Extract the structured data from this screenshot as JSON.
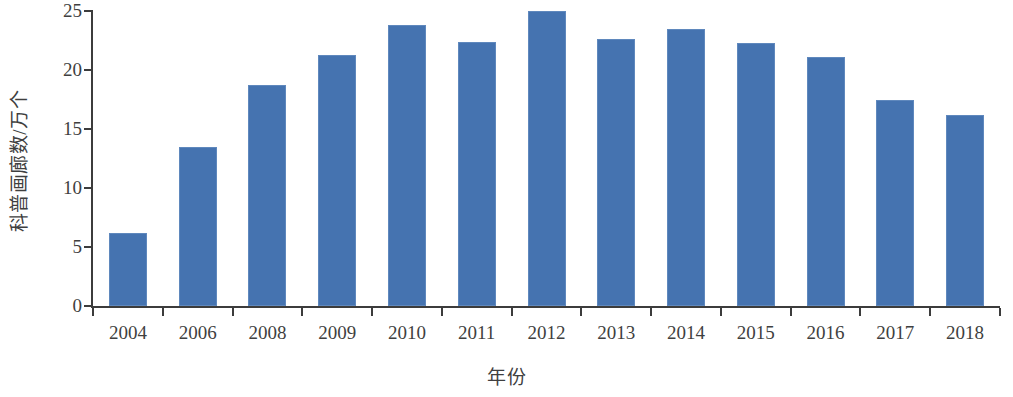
{
  "chart_data": {
    "type": "bar",
    "title": "",
    "xlabel": "年份",
    "ylabel": "科普画廊数/万个",
    "categories": [
      "2004",
      "2006",
      "2008",
      "2009",
      "2010",
      "2011",
      "2012",
      "2013",
      "2014",
      "2015",
      "2016",
      "2017",
      "2018"
    ],
    "values": [
      6.2,
      13.5,
      18.7,
      21.3,
      23.8,
      22.4,
      25.0,
      22.6,
      23.5,
      22.3,
      21.1,
      17.5,
      16.2
    ],
    "series": [
      {
        "name": "科普画廊数",
        "values": [
          6.2,
          13.5,
          18.7,
          21.3,
          23.8,
          22.4,
          25.0,
          22.6,
          23.5,
          22.3,
          21.1,
          17.5,
          16.2
        ]
      }
    ],
    "ylim": [
      0,
      25
    ],
    "yticks": [
      0,
      5,
      10,
      15,
      20,
      25
    ],
    "ytick_labels": [
      "0",
      "5",
      "10",
      "15",
      "20",
      "25"
    ],
    "grid": false,
    "legend": false,
    "legend_position": "none",
    "bar_color": "#4573b0",
    "bar_edge_color": "#5f88bd",
    "axis_color": "#3c3c3c",
    "text_color": "#3f3f3f",
    "background": "#ffffff"
  }
}
